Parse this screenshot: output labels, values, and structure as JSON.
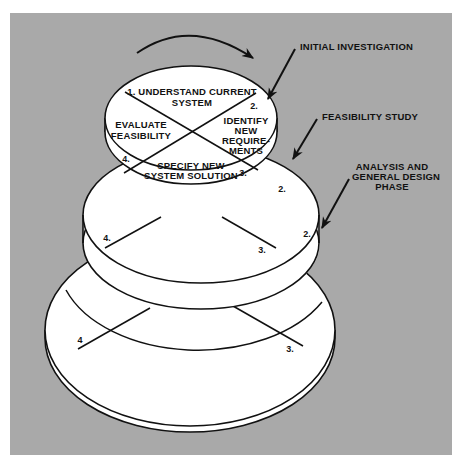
{
  "colors": {
    "background": "#a9a9a9",
    "fill": "#ffffff",
    "stroke": "#111111"
  },
  "callouts": {
    "initial_investigation": "INITIAL INVESTIGATION",
    "feasibility_study": "FEASIBILITY STUDY",
    "analysis_line1": "ANALYSIS AND",
    "analysis_line2": "GENERAL DESIGN",
    "analysis_line3": "PHASE"
  },
  "top_tier": {
    "q1_line1": "1. UNDERSTAND CURRENT",
    "q1_line2": "SYSTEM",
    "q2_number": "2.",
    "q2_line1": "IDENTIFY",
    "q2_line2": "NEW",
    "q2_line3": "REQUIRE-",
    "q2_line4": "MENTS",
    "q3_number": "3.",
    "q3_line1": "SPECIFY NEW",
    "q3_line2": "SYSTEM SOLUTION",
    "q4_number": "4.",
    "q4_line1": "EVALUATE",
    "q4_line2": "FEASIBILITY"
  },
  "middle_tier": {
    "num2": "2.",
    "num3": "3.",
    "num4": "4."
  },
  "bottom_tier": {
    "num2": "2.",
    "num3": "3.",
    "num4": "4"
  }
}
